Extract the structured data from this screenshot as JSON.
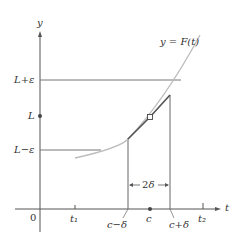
{
  "diagram": {
    "axes": {
      "x_label": "t",
      "y_label": "y",
      "origin_label": "0"
    },
    "curve_label": "y = F(t)",
    "y_ticks": [
      {
        "label": "L+ε",
        "role": "upper-bound"
      },
      {
        "label": "L",
        "role": "limit"
      },
      {
        "label": "L−ε",
        "role": "lower-bound"
      }
    ],
    "x_ticks": [
      {
        "label": "t₁"
      },
      {
        "label": "c−δ"
      },
      {
        "label": "c"
      },
      {
        "label": "c+δ"
      },
      {
        "label": "t₂"
      }
    ],
    "interval_label": "←2δ→",
    "colors": {
      "axis": "#555555",
      "curve_light": "#b8b8b8",
      "curve_dark": "#555555",
      "guide": "#777777"
    }
  }
}
